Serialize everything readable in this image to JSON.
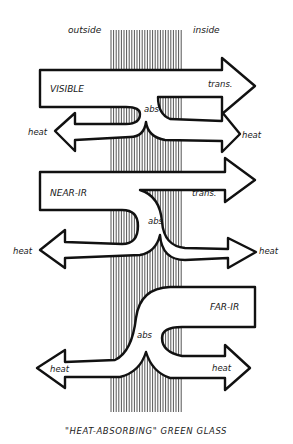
{
  "diagram": {
    "caption": "\"HEAT-ABSORBING\" GREEN GLASS",
    "sides": {
      "outside": "outside",
      "inside": "inside"
    },
    "bands": [
      {
        "name": "VISIBLE",
        "transmitted_label": "trans.",
        "absorbed_label": "abs",
        "heat_left_label": "heat",
        "heat_right_label": "heat"
      },
      {
        "name": "NEAR-IR",
        "transmitted_label": "trans.",
        "absorbed_label": "abs",
        "heat_left_label": "heat",
        "heat_right_label": "heat"
      },
      {
        "name": "FAR-IR",
        "absorbed_label": "abs",
        "heat_left_label": "heat",
        "heat_right_label": "heat"
      }
    ],
    "colors": {
      "ink": "#111111",
      "background": "#ffffff"
    }
  }
}
